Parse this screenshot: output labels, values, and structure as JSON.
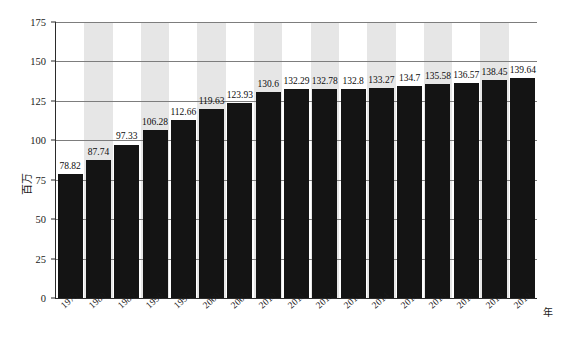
{
  "chart_data": {
    "type": "bar",
    "title": "",
    "xlabel": "年",
    "ylabel": "百万",
    "ylim": [
      0,
      175
    ],
    "yticks": [
      0,
      25,
      50,
      75,
      100,
      125,
      150,
      175
    ],
    "grid": true,
    "legend": "none",
    "categories": [
      "1975",
      "1980",
      "1985",
      "1990",
      "1995",
      "2000",
      "2005",
      "2010",
      "2011",
      "2012",
      "2013",
      "2014",
      "2015",
      "2016",
      "2017",
      "2018",
      "2019"
    ],
    "values": [
      78.82,
      87.74,
      97.33,
      106.28,
      112.66,
      119.63,
      123.93,
      130.6,
      132.29,
      132.78,
      132.8,
      133.27,
      134.7,
      135.58,
      136.57,
      138.45,
      139.64
    ],
    "value_labels": [
      "78.82",
      "87.74",
      "97.33",
      "106.28",
      "112.66",
      "119.63",
      "123.93",
      "130.6",
      "132.29",
      "132.78",
      "132.8",
      "133.27",
      "134.7",
      "135.58",
      "136.57",
      "138.45",
      "139.64"
    ],
    "bar_color": "#141414",
    "band_color": "#e6e6e6",
    "gridline_color": "#7d7d7d",
    "axis_color": "#2b2b2b",
    "background_color": "#ffffff"
  }
}
